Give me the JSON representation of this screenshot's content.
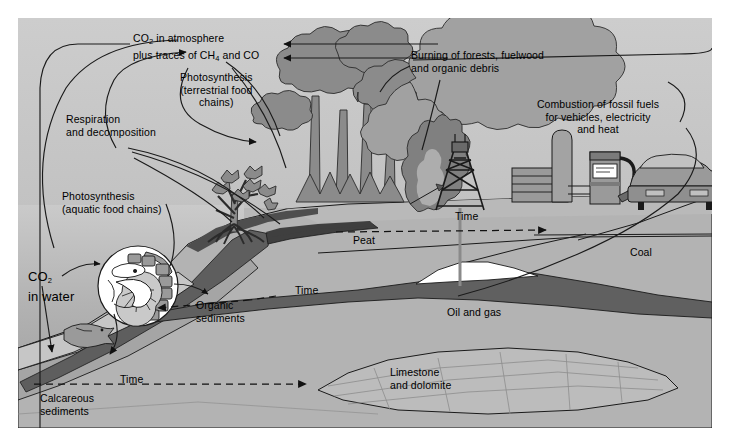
{
  "figure": {
    "background": "#b8b8b8",
    "border_color": "#ffffff"
  },
  "palette": {
    "sky": "#c9c9c9",
    "water_top": "#c4c4c4",
    "water_deep": "#9d9d9d",
    "land": "#b0b0b0",
    "vegetation": "#8e8e8e",
    "smoke": "#a0a0a0",
    "peat_dark": "#4a4a4a",
    "oil_dark": "#6d6d6d",
    "limestone": "#bdbdbd",
    "line": "#1a1a1a",
    "white": "#ffffff"
  },
  "labels": [
    {
      "id": "co2-atmosphere",
      "line1": "CO",
      "sub1": "2",
      "line1b": " in atmosphere",
      "line2": "plus traces of CH",
      "sub2": "4",
      "line2b": " and CO",
      "x": 115,
      "y": 14,
      "align": "left"
    },
    {
      "id": "photosynthesis-terrestrial",
      "text": "Photosynthesis\n(terrestrial food\nchains)",
      "x": 162,
      "y": 53,
      "align": "center"
    },
    {
      "id": "respiration-decomposition",
      "text": "Respiration\nand decomposition",
      "x": 48,
      "y": 95,
      "align": "left"
    },
    {
      "id": "photosynthesis-aquatic",
      "text": "Photosynthesis\n(aquatic food chains)",
      "x": 44,
      "y": 172,
      "align": "left"
    },
    {
      "id": "co2-in-water",
      "line1": "CO",
      "sub1": "2",
      "line2": "in water",
      "x": 10,
      "y": 251,
      "align": "left"
    },
    {
      "id": "burning-of-forests",
      "text": "Burning of forests, fuelwood\nand organic debris",
      "x": 393,
      "y": 31,
      "align": "left"
    },
    {
      "id": "combustion-fossil-fuels",
      "text": "Combustion of fossil fuels\nfor vehicles, electricity\nand heat",
      "x": 580,
      "y": 80,
      "align": "center"
    },
    {
      "id": "time-upper",
      "text": "Time",
      "x": 437,
      "y": 192,
      "align": "left"
    },
    {
      "id": "peat",
      "text": "Peat",
      "x": 335,
      "y": 216,
      "align": "left"
    },
    {
      "id": "coal",
      "text": "Coal",
      "x": 612,
      "y": 228,
      "align": "left"
    },
    {
      "id": "organic-sediments",
      "text": "Organic\nsediments",
      "x": 178,
      "y": 281,
      "align": "left"
    },
    {
      "id": "time-middle",
      "text": "Time",
      "x": 277,
      "y": 266,
      "align": "left"
    },
    {
      "id": "oil-and-gas",
      "text": "Oil and gas",
      "x": 429,
      "y": 288,
      "align": "left"
    },
    {
      "id": "limestone-dolomite",
      "text": "Limestone\nand dolomite",
      "x": 372,
      "y": 348,
      "align": "left"
    },
    {
      "id": "time-lower",
      "text": "Time",
      "x": 102,
      "y": 355,
      "align": "left"
    },
    {
      "id": "calcareous-sediments",
      "text": "Calcareous\nsediments",
      "x": 22,
      "y": 374,
      "align": "left"
    }
  ],
  "scene_elements": [
    {
      "name": "sky",
      "kind": "background"
    },
    {
      "name": "ocean-water",
      "kind": "background"
    },
    {
      "name": "rainforest-trees",
      "kind": "vegetation",
      "count": 5
    },
    {
      "name": "mangrove-shrub",
      "kind": "vegetation"
    },
    {
      "name": "plankton-circle",
      "kind": "inset-illustration"
    },
    {
      "name": "fish",
      "kind": "organism"
    },
    {
      "name": "fire-flame",
      "kind": "emission-source"
    },
    {
      "name": "smoke-plume",
      "kind": "emission-source"
    },
    {
      "name": "oil-derrick",
      "kind": "industry"
    },
    {
      "name": "factory-building",
      "kind": "industry"
    },
    {
      "name": "storage-tank",
      "kind": "industry"
    },
    {
      "name": "fuel-pump",
      "kind": "industry"
    },
    {
      "name": "car",
      "kind": "vehicle"
    },
    {
      "name": "peat-layer",
      "kind": "geology"
    },
    {
      "name": "coal-seam",
      "kind": "geology"
    },
    {
      "name": "oil-gas-reservoir",
      "kind": "geology"
    },
    {
      "name": "limestone-layer",
      "kind": "geology"
    },
    {
      "name": "calcareous-sediment-layer",
      "kind": "geology"
    }
  ],
  "flow_arrows": [
    {
      "name": "respiration-to-atmosphere",
      "label_ref": "respiration-decomposition"
    },
    {
      "name": "aquatic-photosynthesis-to-atmosphere",
      "label_ref": "photosynthesis-aquatic"
    },
    {
      "name": "atmosphere-to-terrestrial-plants",
      "label_ref": "photosynthesis-terrestrial"
    },
    {
      "name": "burning-to-atmosphere",
      "label_ref": "burning-of-forests"
    },
    {
      "name": "combustion-to-atmosphere",
      "label_ref": "combustion-fossil-fuels"
    },
    {
      "name": "co2-water-to-plankton",
      "label_ref": "co2-in-water"
    },
    {
      "name": "plankton-to-sediments",
      "label_ref": "organic-sediments"
    },
    {
      "name": "co2-water-to-seafloor",
      "label_ref": "co2-in-water"
    },
    {
      "name": "time-peat-to-coal",
      "label_ref": "time-upper"
    },
    {
      "name": "time-organic-to-oil",
      "label_ref": "time-middle"
    },
    {
      "name": "time-calcareous-to-limestone",
      "label_ref": "time-lower"
    }
  ]
}
